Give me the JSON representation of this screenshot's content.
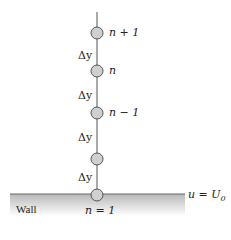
{
  "diagram": {
    "nodes": [
      {
        "label": "n + 1",
        "y": 33
      },
      {
        "label": "n",
        "y": 71
      },
      {
        "label": "n − 1",
        "y": 113
      },
      {
        "label": "",
        "y": 159
      },
      {
        "label": "n = 1",
        "y": 195
      }
    ],
    "spacing_labels": [
      "Δy",
      "Δy",
      "Δy",
      "Δy"
    ],
    "wall_label": "Wall",
    "boundary_condition": "u = U",
    "boundary_subscript": "0",
    "colors": {
      "node_fill": "#d0d0d0",
      "node_stroke": "#555555",
      "line": "#555555",
      "wall_shade": "#c8c8c8"
    }
  }
}
